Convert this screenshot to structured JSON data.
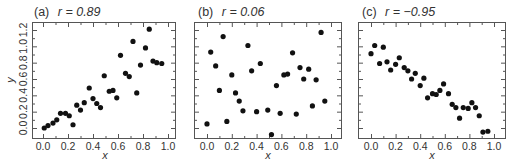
{
  "figure": {
    "panels_count": 3,
    "colors": {
      "point": "#111111",
      "frame": "#555555",
      "text": "#333333",
      "background": "#ffffff"
    }
  },
  "chart_data": [
    {
      "type": "scatter",
      "panel": "(a)",
      "title": "(a) r = 0.89",
      "title_prefix": "(a)",
      "title_stat": "r = 0.89",
      "r": 0.89,
      "xlabel": "x",
      "ylabel": "y",
      "xlim": [
        -0.09,
        1.05
      ],
      "ylim": [
        -0.12,
        1.3
      ],
      "xticks": [
        0.0,
        0.2,
        0.4,
        0.6,
        0.8,
        1.0
      ],
      "xtick_labels": [
        "0.0",
        "0.2",
        "0.4",
        "0.6",
        "0.8",
        "1.0"
      ],
      "yticks": [
        0.0,
        0.2,
        0.4,
        0.6,
        0.8,
        1.0,
        1.2
      ],
      "ytick_labels": [
        "0.0",
        "0.2",
        "0.4",
        "0.6",
        "0.8",
        "1.0",
        "1.2"
      ],
      "grid": false,
      "x": [
        0.01,
        0.04,
        0.08,
        0.11,
        0.14,
        0.18,
        0.21,
        0.24,
        0.27,
        0.3,
        0.33,
        0.37,
        0.4,
        0.43,
        0.46,
        0.49,
        0.53,
        0.56,
        0.59,
        0.62,
        0.66,
        0.69,
        0.72,
        0.75,
        0.78,
        0.82,
        0.85,
        0.88,
        0.91,
        0.95
      ],
      "y": [
        0.0,
        0.03,
        0.06,
        0.1,
        0.18,
        0.18,
        0.15,
        0.04,
        0.28,
        0.22,
        0.31,
        0.49,
        0.36,
        0.3,
        0.25,
        0.64,
        0.45,
        0.46,
        0.37,
        0.89,
        0.67,
        0.63,
        1.06,
        0.43,
        0.77,
        0.98,
        1.21,
        0.82,
        0.8,
        0.79
      ]
    },
    {
      "type": "scatter",
      "panel": "(b)",
      "title": "(b) r = 0.06",
      "title_prefix": "(b)",
      "title_stat": "r = 0.06",
      "r": 0.06,
      "xlabel": "x",
      "ylabel": "",
      "xlim": [
        -0.09,
        1.05
      ],
      "ylim": [
        -0.12,
        1.3
      ],
      "xticks": [
        0.0,
        0.2,
        0.4,
        0.6,
        0.8,
        1.0
      ],
      "xtick_labels": [
        "0.0",
        "0.2",
        "0.4",
        "0.6",
        "0.8",
        "1.0"
      ],
      "yticks": [
        0.0,
        0.2,
        0.4,
        0.6,
        0.8,
        1.0,
        1.2
      ],
      "ytick_labels": [],
      "grid": false,
      "x": [
        0.0,
        0.03,
        0.07,
        0.1,
        0.13,
        0.16,
        0.2,
        0.23,
        0.26,
        0.29,
        0.33,
        0.36,
        0.4,
        0.43,
        0.49,
        0.52,
        0.56,
        0.59,
        0.62,
        0.65,
        0.69,
        0.72,
        0.75,
        0.78,
        0.82,
        0.85,
        0.88,
        0.92,
        0.95
      ],
      "y": [
        0.05,
        0.93,
        0.76,
        0.46,
        1.12,
        0.08,
        0.65,
        0.43,
        0.33,
        0.21,
        1.01,
        0.7,
        0.2,
        0.79,
        0.22,
        -0.08,
        0.52,
        0.18,
        0.65,
        0.66,
        0.92,
        0.17,
        0.74,
        0.6,
        0.72,
        0.27,
        0.59,
        1.17,
        0.33
      ]
    },
    {
      "type": "scatter",
      "panel": "(c)",
      "title": "(c) r = −0.95",
      "title_prefix": "(c)",
      "title_stat": "r = −0.95",
      "r": -0.95,
      "xlabel": "x",
      "ylabel": "",
      "xlim": [
        -0.09,
        1.05
      ],
      "ylim": [
        -0.12,
        1.3
      ],
      "xticks": [
        0.0,
        0.2,
        0.4,
        0.6,
        0.8,
        1.0
      ],
      "xtick_labels": [
        "0.0",
        "0.2",
        "0.4",
        "0.6",
        "0.8",
        "1.0"
      ],
      "yticks": [
        0.0,
        0.2,
        0.4,
        0.6,
        0.8,
        1.0,
        1.2
      ],
      "ytick_labels": [],
      "grid": false,
      "x": [
        0.0,
        0.03,
        0.07,
        0.1,
        0.13,
        0.16,
        0.2,
        0.23,
        0.27,
        0.3,
        0.33,
        0.36,
        0.4,
        0.43,
        0.46,
        0.5,
        0.53,
        0.56,
        0.59,
        0.63,
        0.66,
        0.69,
        0.72,
        0.75,
        0.79,
        0.82,
        0.85,
        0.88,
        0.91,
        0.95
      ],
      "y": [
        0.91,
        1.01,
        0.79,
        0.99,
        0.81,
        0.71,
        0.78,
        0.86,
        0.74,
        0.7,
        0.6,
        0.67,
        0.52,
        0.61,
        0.37,
        0.42,
        0.41,
        0.46,
        0.54,
        0.42,
        0.29,
        0.25,
        0.12,
        0.25,
        0.24,
        0.31,
        0.25,
        0.15,
        -0.05,
        -0.04
      ]
    }
  ],
  "layout": {
    "panels": [
      {
        "frame": {
          "left": 32,
          "top": 22,
          "right": 175,
          "bottom": 138
        },
        "x0_px": 43,
        "x1_px": 168,
        "show_ytick_labels": true
      },
      {
        "frame": {
          "left": 194,
          "top": 22,
          "right": 341,
          "bottom": 138
        },
        "x0_px": 207,
        "x1_px": 331,
        "show_ytick_labels": false
      },
      {
        "frame": {
          "left": 358,
          "top": 22,
          "right": 505,
          "bottom": 138
        },
        "x0_px": 371,
        "x1_px": 494,
        "show_ytick_labels": false
      }
    ],
    "y0_px": 128,
    "y12_px": 30
  }
}
